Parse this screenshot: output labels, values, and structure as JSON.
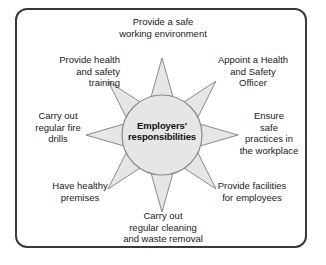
{
  "diagram": {
    "title": "Employers' responsibilities",
    "type": "radial-sunburst",
    "frame": {
      "border_color": "#3a3a3a",
      "background_color": "#ffffff"
    },
    "hub": {
      "label_line_1": "Employers'",
      "label_line_2": "responsibilities",
      "label": "Employers' responsibilities",
      "fill_color": "#e6e6e6",
      "stroke_color": "#8a8a8a"
    },
    "ray_style": {
      "fill_color": "#e6e6e6",
      "stroke_color": "#8a8a8a"
    },
    "rays": [
      {
        "id": "ray-north",
        "direction": "north",
        "angle_deg": 90,
        "label": "Provide a safe\nworking environment"
      },
      {
        "id": "ray-northeast",
        "direction": "northeast",
        "angle_deg": 45,
        "label": "Appoint a Health\nand Safety\nOfficer"
      },
      {
        "id": "ray-east",
        "direction": "east",
        "angle_deg": 0,
        "label": "Ensure\nsafe\npractices in\nthe workplace"
      },
      {
        "id": "ray-southeast",
        "direction": "southeast",
        "angle_deg": 315,
        "label": "Provide facilities\nfor employees"
      },
      {
        "id": "ray-south",
        "direction": "south",
        "angle_deg": 270,
        "label": "Carry out\nregular cleaning\nand waste removal"
      },
      {
        "id": "ray-southwest",
        "direction": "southwest",
        "angle_deg": 225,
        "label": "Have healthy\npremises"
      },
      {
        "id": "ray-west",
        "direction": "west",
        "angle_deg": 180,
        "label": "Carry out\nregular fire\ndrills"
      },
      {
        "id": "ray-northwest",
        "direction": "northwest",
        "angle_deg": 135,
        "label": "Provide health\nand safety\ntraining"
      }
    ]
  }
}
